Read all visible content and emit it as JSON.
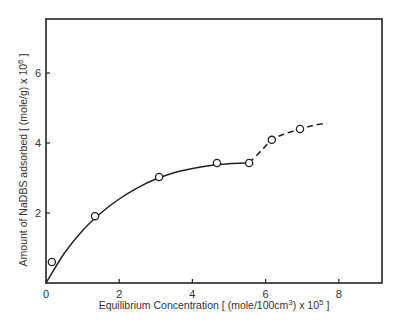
{
  "chart_data": {
    "type": "scatter",
    "title": "",
    "xlabel": "Equilibrium Concentration [ (mole/100cm3) x 105 ]",
    "xlabel_parts": {
      "pre": "Equilibrium Concentration [ (mole/100cm",
      "sup1": "3",
      "mid": ") x 10",
      "sup2": "5",
      "post": " ]"
    },
    "ylabel": "Amount of NaDBS adsorbed [ (mole/g) x 106 ]",
    "ylabel_parts": {
      "pre": "Amount of NaDBS adsorbed [ (mole/g) x 10",
      "sup": "6",
      "post": " ]"
    },
    "xlim": [
      0,
      9.2
    ],
    "ylim": [
      0,
      7.5
    ],
    "x_ticks": [
      0,
      2,
      4,
      6,
      8
    ],
    "x_tick_labels": [
      "0",
      "2",
      "4",
      "6",
      "8"
    ],
    "y_ticks": [
      2,
      4,
      6
    ],
    "y_tick_labels": [
      "2",
      "4",
      "6"
    ],
    "grid": false,
    "legend": null,
    "series": [
      {
        "name": "Measured points",
        "marker": "open-circle",
        "x": [
          0.16,
          1.34,
          3.09,
          4.67,
          5.55,
          6.17,
          6.94
        ],
        "y": [
          0.6,
          1.91,
          3.03,
          3.43,
          3.43,
          4.09,
          4.4
        ]
      },
      {
        "name": "Fitted curve (solid)",
        "style": "solid",
        "x": [
          0,
          0.5,
          1.0,
          1.5,
          2.0,
          2.5,
          3.0,
          3.5,
          4.0,
          4.5,
          5.0,
          5.55
        ],
        "y": [
          0,
          0.85,
          1.5,
          2.0,
          2.4,
          2.72,
          2.97,
          3.15,
          3.27,
          3.36,
          3.41,
          3.43
        ]
      },
      {
        "name": "Extension (dashed)",
        "style": "dashed",
        "x": [
          5.55,
          5.9,
          6.17,
          6.5,
          6.94,
          7.3,
          7.68
        ],
        "y": [
          3.43,
          3.8,
          4.09,
          4.25,
          4.4,
          4.5,
          4.57
        ]
      }
    ]
  }
}
